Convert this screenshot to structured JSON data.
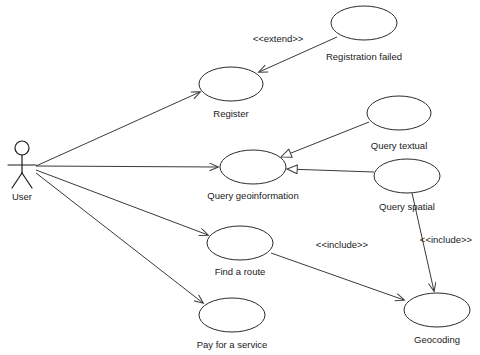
{
  "diagram": {
    "type": "uml-use-case",
    "background_color": "#ffffff",
    "line_color": "#3a3a3a",
    "text_color": "#1a1a1a"
  },
  "actors": [
    {
      "id": "user",
      "label": "User",
      "x": 22,
      "y": 168,
      "label_x": 22,
      "label_y": 197
    }
  ],
  "use_cases": [
    {
      "id": "registration_failed",
      "label": "Registration failed",
      "cx": 364,
      "cy": 23,
      "rx": 33,
      "ry": 17,
      "label_x": 364,
      "label_y": 57
    },
    {
      "id": "register",
      "label": "Register",
      "cx": 231,
      "cy": 84,
      "rx": 32,
      "ry": 17,
      "label_x": 231,
      "label_y": 114
    },
    {
      "id": "query_textual",
      "label": "Query textual",
      "cx": 399,
      "cy": 113,
      "rx": 32,
      "ry": 17,
      "label_x": 399,
      "label_y": 146
    },
    {
      "id": "query_geoinformation",
      "label": "Query geoinformation",
      "cx": 253,
      "cy": 167,
      "rx": 33,
      "ry": 17,
      "label_x": 253,
      "label_y": 196
    },
    {
      "id": "query_spatial",
      "label": "Query spatial",
      "cx": 407,
      "cy": 176,
      "rx": 33,
      "ry": 17,
      "label_x": 407,
      "label_y": 207
    },
    {
      "id": "find_a_route",
      "label": "Find a route",
      "cx": 240,
      "cy": 243,
      "rx": 33,
      "ry": 17,
      "label_x": 240,
      "label_y": 272
    },
    {
      "id": "pay_for_a_service",
      "label": "Pay for a service",
      "cx": 232,
      "cy": 315,
      "rx": 33,
      "ry": 17,
      "label_x": 232,
      "label_y": 345
    },
    {
      "id": "geocoding",
      "label": "Geocoding",
      "cx": 437,
      "cy": 310,
      "rx": 33,
      "ry": 17,
      "label_x": 437,
      "label_y": 340
    }
  ],
  "relationships": [
    {
      "id": "user-register",
      "from": "user",
      "to": "register",
      "kind": "association",
      "arrow": "open",
      "x1": 36,
      "y1": 166,
      "x2": 200,
      "y2": 92
    },
    {
      "id": "user-query-geoinformation",
      "from": "user",
      "to": "query_geoinformation",
      "kind": "association",
      "arrow": "open",
      "x1": 36,
      "y1": 166,
      "x2": 218,
      "y2": 167
    },
    {
      "id": "user-find-a-route",
      "from": "user",
      "to": "find_a_route",
      "kind": "association",
      "arrow": "open",
      "x1": 36,
      "y1": 170,
      "x2": 208,
      "y2": 235
    },
    {
      "id": "user-pay-for-a-service",
      "from": "user",
      "to": "pay_for_a_service",
      "kind": "association",
      "arrow": "open",
      "x1": 36,
      "y1": 173,
      "x2": 203,
      "y2": 303
    },
    {
      "id": "registration-failed-extend-register",
      "from": "registration_failed",
      "to": "register",
      "kind": "extend",
      "arrow": "open",
      "label": "<<extend>>",
      "label_x": 278,
      "label_y": 39,
      "x1": 337,
      "y1": 37,
      "x2": 259,
      "y2": 72
    },
    {
      "id": "query-textual-gen-query-geoinformation",
      "from": "query_textual",
      "to": "query_geoinformation",
      "kind": "generalization",
      "arrow": "hollow-triangle",
      "x1": 369,
      "y1": 122,
      "x2": 281,
      "y2": 157
    },
    {
      "id": "query-spatial-gen-query-geoinformation",
      "from": "query_spatial",
      "to": "query_geoinformation",
      "kind": "generalization",
      "arrow": "hollow-triangle",
      "x1": 374,
      "y1": 172,
      "x2": 287,
      "y2": 169
    },
    {
      "id": "find-a-route-include-geocoding",
      "from": "find_a_route",
      "to": "geocoding",
      "kind": "include",
      "arrow": "open",
      "label": "<<include>>",
      "label_x": 342,
      "label_y": 245,
      "x1": 271,
      "y1": 253,
      "x2": 404,
      "y2": 300
    },
    {
      "id": "query-spatial-include-geocoding",
      "from": "query_spatial",
      "to": "geocoding",
      "kind": "include",
      "arrow": "open",
      "label": "<<include>>",
      "label_x": 446,
      "label_y": 240,
      "x1": 412,
      "y1": 193,
      "x2": 434,
      "y2": 291
    }
  ]
}
